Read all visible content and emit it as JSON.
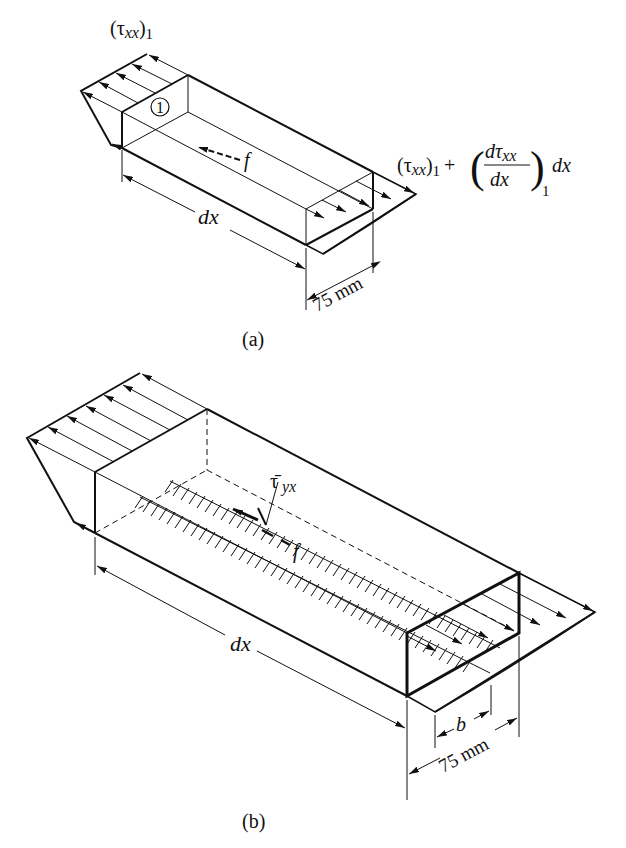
{
  "figure_a": {
    "caption": "(a)",
    "label_left_stress": {
      "open": "(τ",
      "sub": "xx",
      "close": ")",
      "sub2": "1"
    },
    "label_right_stress": {
      "base_open": "(τ",
      "base_sub": "xx",
      "base_close": ")",
      "base_sub2": "1",
      "plus": "+",
      "num": "dτ",
      "num_sub": "xx",
      "den": "dx",
      "paren_sub": "1",
      "tail": "dx"
    },
    "element_number": "1",
    "force_label": "f",
    "length_label": "dx",
    "width_label": "75 mm"
  },
  "figure_b": {
    "caption": "(b)",
    "shear_label": {
      "base": "τ̄",
      "sub": "yx"
    },
    "force_label": "f",
    "length_label": "dx",
    "inner_width_label": "b",
    "width_label": "75 mm"
  },
  "colors": {
    "ink": "#111111",
    "background": "#ffffff"
  }
}
